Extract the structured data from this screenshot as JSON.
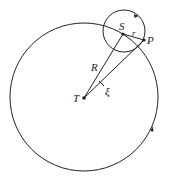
{
  "diagram": {
    "type": "orbital-geometry",
    "labels": {
      "S": "S",
      "r": "r",
      "P": "P",
      "R": "R",
      "T": "T",
      "xi": "ξ"
    },
    "stroke_color": "#222222",
    "background": "#ffffff"
  }
}
